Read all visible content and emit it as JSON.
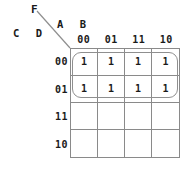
{
  "diagram": {
    "type": "karnaugh-map",
    "function_label": "F",
    "variables": {
      "column_vars_label": "A B",
      "row_vars_label": "C D",
      "column_variables": [
        "A",
        "B"
      ],
      "row_variables": [
        "C",
        "D"
      ]
    },
    "column_headers": [
      "00",
      "01",
      "11",
      "10"
    ],
    "row_headers": [
      "00",
      "01",
      "11",
      "10"
    ],
    "cells": [
      [
        "1",
        "1",
        "1",
        "1"
      ],
      [
        "1",
        "1",
        "1",
        "1"
      ],
      [
        "",
        "",
        "",
        ""
      ],
      [
        "",
        "",
        "",
        ""
      ]
    ],
    "groups": [
      {
        "name": "group-top-eight",
        "cell_count": 8,
        "covers_rows": [
          "00",
          "01"
        ],
        "covers_columns": [
          "00",
          "01",
          "11",
          "10"
        ]
      }
    ],
    "colors": {
      "grid_line": "#8a8a8a",
      "group_loop": "#8f8f8f",
      "text": "#1a1a1a",
      "leader_line": "#8f8f8f",
      "background": "#ffffff"
    }
  }
}
